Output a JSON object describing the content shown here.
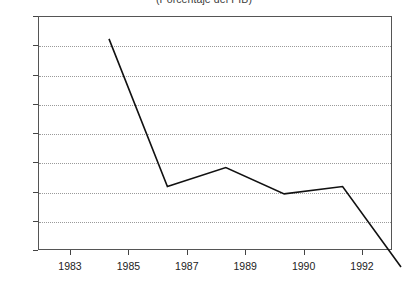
{
  "chart_data": {
    "type": "line",
    "title": "(Porcentaje del PIB)",
    "xlabel": "",
    "ylabel": "",
    "x": [
      1983,
      1985,
      1987,
      1989,
      1990,
      1992
    ],
    "categories": [
      "1983",
      "1985",
      "1987",
      "1989",
      "1990",
      "1992"
    ],
    "values": [
      15.6,
      5.5,
      6.8,
      5.0,
      5.5,
      0.0
    ],
    "series": [
      {
        "name": "Porcentaje del PIB",
        "values": [
          15.6,
          5.5,
          6.8,
          5.0,
          5.5,
          0.0
        ]
      }
    ],
    "ylim": [
      0,
      16
    ],
    "y_ticks": [
      0,
      2,
      4,
      6,
      8,
      10,
      12,
      14,
      16
    ],
    "y_tick_labels": [
      "0",
      "2",
      "4",
      "6",
      "8",
      "10",
      "12",
      "14",
      "16"
    ],
    "x_tick_labels": [
      "1983",
      "1985",
      "1987",
      "1989",
      "1990",
      "1992"
    ],
    "grid": true,
    "grid_axis": "y",
    "grid_style": "dotted",
    "legend": false,
    "legend_position": "none",
    "line_color": "#111111",
    "background_color": "#ffffff",
    "frame_color": "#555555"
  }
}
